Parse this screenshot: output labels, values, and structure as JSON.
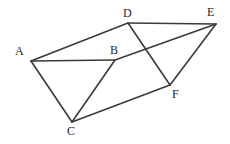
{
  "figure": {
    "type": "geometry-diagram",
    "width": 230,
    "height": 144,
    "background_color": "#ffffff",
    "stroke_color": "#3a3a3a",
    "stroke_width": 1.6,
    "label_color": "#262626",
    "vertices": [
      {
        "id": "A",
        "label": "A",
        "x": 31,
        "y": 61,
        "label_x": 15,
        "label_y": 45
      },
      {
        "id": "B",
        "label": "B",
        "x": 115,
        "y": 60,
        "label_x": 110,
        "label_y": 44
      },
      {
        "id": "C",
        "label": "C",
        "x": 72,
        "y": 122,
        "label_x": 67,
        "label_y": 125
      },
      {
        "id": "D",
        "label": "D",
        "x": 128,
        "y": 23,
        "label_x": 123,
        "label_y": 7
      },
      {
        "id": "E",
        "label": "E",
        "x": 216,
        "y": 24,
        "label_x": 207,
        "label_y": 6
      },
      {
        "id": "F",
        "label": "F",
        "x": 170,
        "y": 85,
        "label_x": 172,
        "label_y": 88
      }
    ],
    "edges": [
      {
        "id": "A-D",
        "from": "A",
        "to": "D"
      },
      {
        "id": "A-B",
        "from": "A",
        "to": "B"
      },
      {
        "id": "A-C",
        "from": "A",
        "to": "C"
      },
      {
        "id": "B-C",
        "from": "B",
        "to": "C"
      },
      {
        "id": "B-E",
        "from": "B",
        "to": "E"
      },
      {
        "id": "C-F",
        "from": "C",
        "to": "F"
      },
      {
        "id": "D-E",
        "from": "D",
        "to": "E"
      },
      {
        "id": "D-F",
        "from": "D",
        "to": "F"
      },
      {
        "id": "E-F",
        "from": "E",
        "to": "F"
      }
    ]
  }
}
